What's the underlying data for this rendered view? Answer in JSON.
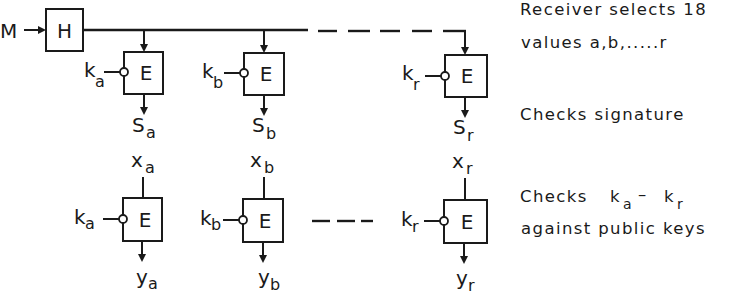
{
  "diagram": {
    "input": {
      "label": "M"
    },
    "hash_block": {
      "label": "H"
    },
    "signing_row": {
      "blocks": [
        {
          "id": "a",
          "label": "E",
          "key_main": "k",
          "key_sub": "a",
          "out_main": "S",
          "out_sub": "a"
        },
        {
          "id": "b",
          "label": "E",
          "key_main": "k",
          "key_sub": "b",
          "out_main": "S",
          "out_sub": "b"
        },
        {
          "id": "r",
          "label": "E",
          "key_main": "k",
          "key_sub": "r",
          "out_main": "S",
          "out_sub": "r"
        }
      ]
    },
    "verify_row": {
      "blocks": [
        {
          "id": "a",
          "label": "E",
          "in_main": "x",
          "in_sub": "a",
          "key_main": "k",
          "key_sub": "a",
          "out_main": "y",
          "out_sub": "a"
        },
        {
          "id": "b",
          "label": "E",
          "in_main": "x",
          "in_sub": "b",
          "key_main": "k",
          "key_sub": "b",
          "out_main": "y",
          "out_sub": "b"
        },
        {
          "id": "r",
          "label": "E",
          "in_main": "x",
          "in_sub": "r",
          "key_main": "k",
          "key_sub": "r",
          "out_main": "y",
          "out_sub": "r"
        }
      ]
    },
    "annotations": {
      "select_line1": "Receiver selects 18",
      "select_line2": "values a,b,.....r",
      "checks_signature": "Checks  signature",
      "checks_keys_prefix": "Checks",
      "checks_keys_k1": "k",
      "checks_keys_s1": "a",
      "checks_keys_dash": "–",
      "checks_keys_k2": "k",
      "checks_keys_s2": "r",
      "checks_keys_line2": "against  public keys"
    }
  }
}
